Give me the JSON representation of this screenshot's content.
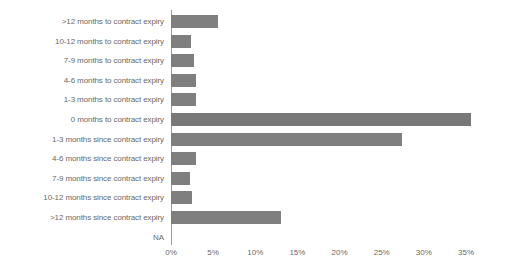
{
  "chart_data": {
    "type": "bar",
    "orientation": "horizontal",
    "title": "",
    "subtitle": "",
    "xlabel": "",
    "ylabel": "",
    "xlim": [
      0,
      37
    ],
    "grid": false,
    "legend": null,
    "categories": [
      ">12 months to contract expiry",
      "10-12 months to contract expiry",
      "7-9 months to contract expiry",
      "4-6 months to contract expiry",
      "1-3 months to contract expiry",
      "0 months to contract expiry",
      "1-3 months since contract expiry",
      "4-6 months since contract expiry",
      "7-9 months since contract expiry",
      "10-12 months since contract expiry",
      ">12 months since contract expiry",
      "NA"
    ],
    "values": [
      5.6,
      2.4,
      2.7,
      3.0,
      3.0,
      35.6,
      27.4,
      3.0,
      2.3,
      2.5,
      13.0,
      0
    ],
    "value_labels": [
      "5.6%",
      "2.4%",
      "2.7%",
      "3.0%",
      "3.0%",
      "35.6%",
      "27.4%",
      "3.0%",
      "2.3%",
      "2.5%",
      "13.0%",
      ""
    ],
    "tick_values": [
      0,
      5,
      10,
      15,
      20,
      25,
      30,
      35
    ],
    "tick_labels": [
      "0%",
      "5%",
      "10%",
      "15%",
      "20%",
      "25%",
      "30%",
      "35%"
    ],
    "colors": {
      "bar": "#7f7f7f",
      "bar_emphasis": "#787878",
      "axis": "#9a9a9a",
      "text": "#6a6a6a",
      "background": "#ffffff"
    }
  }
}
